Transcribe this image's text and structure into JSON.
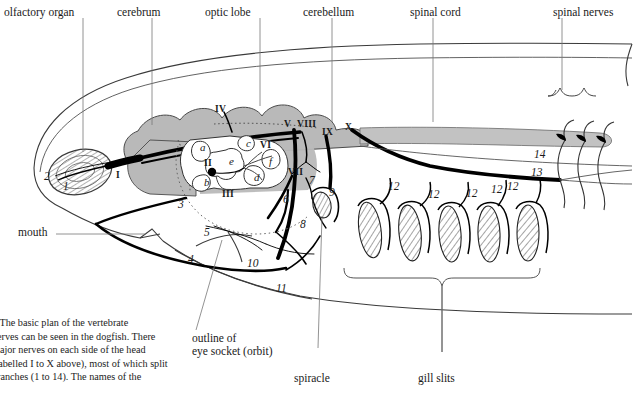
{
  "figure": {
    "caption_lines": [
      "4  The basic plan of the vertebrate",
      "nerves can be seen in the dogfish. There",
      "major nerves on each side of the head",
      "(labelled I to X above), most of which split",
      "branches (1 to 14). The names of the"
    ]
  },
  "top_labels": [
    {
      "text": "olfactory organ",
      "id": "olfactory-organ"
    },
    {
      "text": "cerebrum",
      "id": "cerebrum"
    },
    {
      "text": "optic lobe",
      "id": "optic-lobe"
    },
    {
      "text": "cerebellum",
      "id": "cerebellum"
    },
    {
      "text": "spinal cord",
      "id": "spinal-cord"
    },
    {
      "text": "spinal nerves",
      "id": "spinal-nerves"
    }
  ],
  "side_labels": [
    {
      "text": "mouth",
      "id": "mouth"
    }
  ],
  "bottom_labels": [
    {
      "text": "outline of",
      "id": "orbit-line1"
    },
    {
      "text": "eye socket (orbit)",
      "id": "orbit-line2"
    },
    {
      "text": "spiracle",
      "id": "spiracle"
    },
    {
      "text": "gill slits",
      "id": "gill-slits"
    }
  ],
  "cranial_nerves": [
    {
      "numeral": "I",
      "x": 116,
      "y": 176
    },
    {
      "numeral": "II",
      "x": 205,
      "y": 163
    },
    {
      "numeral": "III",
      "x": 224,
      "y": 193
    },
    {
      "numeral": "IV",
      "x": 218,
      "y": 109
    },
    {
      "numeral": "V",
      "x": 286,
      "y": 124
    },
    {
      "numeral": "VI",
      "x": 262,
      "y": 145
    },
    {
      "numeral": "VII",
      "x": 291,
      "y": 172
    },
    {
      "numeral": "VIII",
      "x": 300,
      "y": 124
    },
    {
      "numeral": "IX",
      "x": 325,
      "y": 132
    },
    {
      "numeral": "X",
      "x": 348,
      "y": 127
    }
  ],
  "orbit_letters": [
    {
      "letter": "a",
      "x": 203,
      "y": 147
    },
    {
      "letter": "b",
      "x": 207,
      "y": 182
    },
    {
      "letter": "c",
      "x": 249,
      "y": 143
    },
    {
      "letter": "d",
      "x": 257,
      "y": 177
    },
    {
      "letter": "e",
      "x": 232,
      "y": 161
    },
    {
      "letter": "f",
      "x": 272,
      "y": 161
    }
  ],
  "branch_numbers": [
    {
      "n": "1",
      "x": 65,
      "y": 186
    },
    {
      "n": "2",
      "x": 47,
      "y": 178
    },
    {
      "n": "3",
      "x": 181,
      "y": 204
    },
    {
      "n": "4",
      "x": 191,
      "y": 259
    },
    {
      "n": "5",
      "x": 207,
      "y": 232
    },
    {
      "n": "6",
      "x": 286,
      "y": 199
    },
    {
      "n": "7",
      "x": 312,
      "y": 180
    },
    {
      "n": "8",
      "x": 303,
      "y": 224
    },
    {
      "n": "9",
      "x": 331,
      "y": 192
    },
    {
      "n": "10",
      "x": 252,
      "y": 263
    },
    {
      "n": "11",
      "x": 281,
      "y": 288
    },
    {
      "n": "12",
      "x": 392,
      "y": 186
    },
    {
      "n": "12",
      "x": 432,
      "y": 194
    },
    {
      "n": "12",
      "x": 470,
      "y": 193
    },
    {
      "n": "12",
      "x": 494,
      "y": 189
    },
    {
      "n": "12",
      "x": 510,
      "y": 186
    },
    {
      "n": "13",
      "x": 534,
      "y": 172
    },
    {
      "n": "14",
      "x": 537,
      "y": 154
    }
  ],
  "colors": {
    "brain_fill": "#b9b9b9",
    "cord_fill": "#c2c2c2",
    "nerve_black": "#000000",
    "outline": "#333333",
    "hatch": "#444444",
    "text": "#1a1a1a"
  }
}
